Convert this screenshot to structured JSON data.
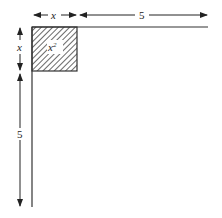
{
  "diagram": {
    "top_dim_x": "x",
    "top_dim_5": "5",
    "left_dim_x": "x",
    "left_dim_5": "5",
    "square_label": "x",
    "square_exponent": "2"
  },
  "colors": {
    "stroke": "#333333",
    "hatch": "#444444",
    "background": "#ffffff"
  }
}
